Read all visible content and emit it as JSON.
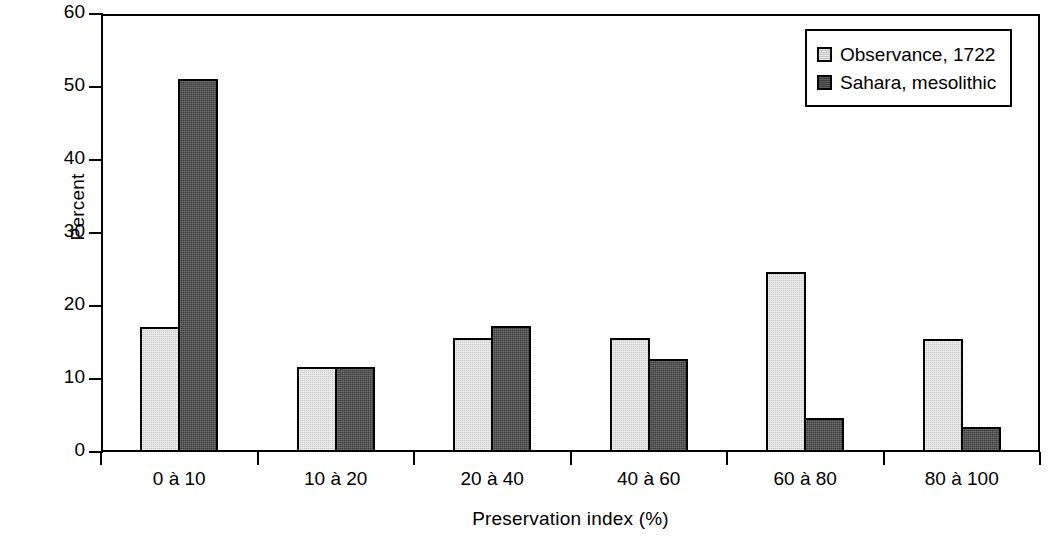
{
  "chart_data": {
    "type": "bar",
    "title": "",
    "xlabel": "Preservation index (%)",
    "ylabel": "Percent",
    "categories": [
      "0 à 10",
      "10 à 20",
      "20 à 40",
      "40 à 60",
      "60 à 80",
      "80 à 100"
    ],
    "series": [
      {
        "name": "Observance, 1722",
        "color": "#c9c9c9",
        "values": [
          17.1,
          11.6,
          15.6,
          15.6,
          24.6,
          15.5
        ]
      },
      {
        "name": "Sahara, mesolithic",
        "color": "#3b3b3b",
        "values": [
          51.1,
          11.6,
          17.2,
          12.7,
          4.7,
          3.4
        ]
      }
    ],
    "ylim": [
      0,
      60
    ],
    "ytick_step": 10,
    "yticks": [
      "0",
      "10",
      "20",
      "30",
      "40",
      "50",
      "60"
    ],
    "grid": false,
    "legend_position": "top-right",
    "frame": true
  },
  "legend": {
    "entries": [
      {
        "label": "Observance, 1722"
      },
      {
        "label": "Sahara, mesolithic"
      }
    ]
  }
}
